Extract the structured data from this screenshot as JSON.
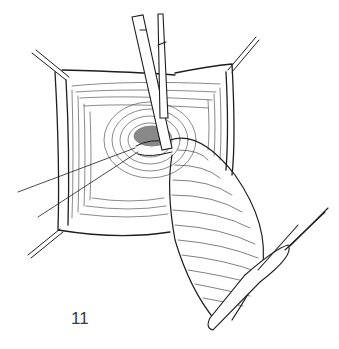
{
  "figure": {
    "label": "11",
    "ink_color": "#1e1e1e",
    "background_color": "#ffffff",
    "elements": {
      "stay_sutures": [
        "top-left",
        "top-right",
        "bottom-left",
        "bottom-right"
      ],
      "instruments": [
        "forceps",
        "straight-clamp",
        "tip-clamp"
      ],
      "threads": 2
    }
  }
}
